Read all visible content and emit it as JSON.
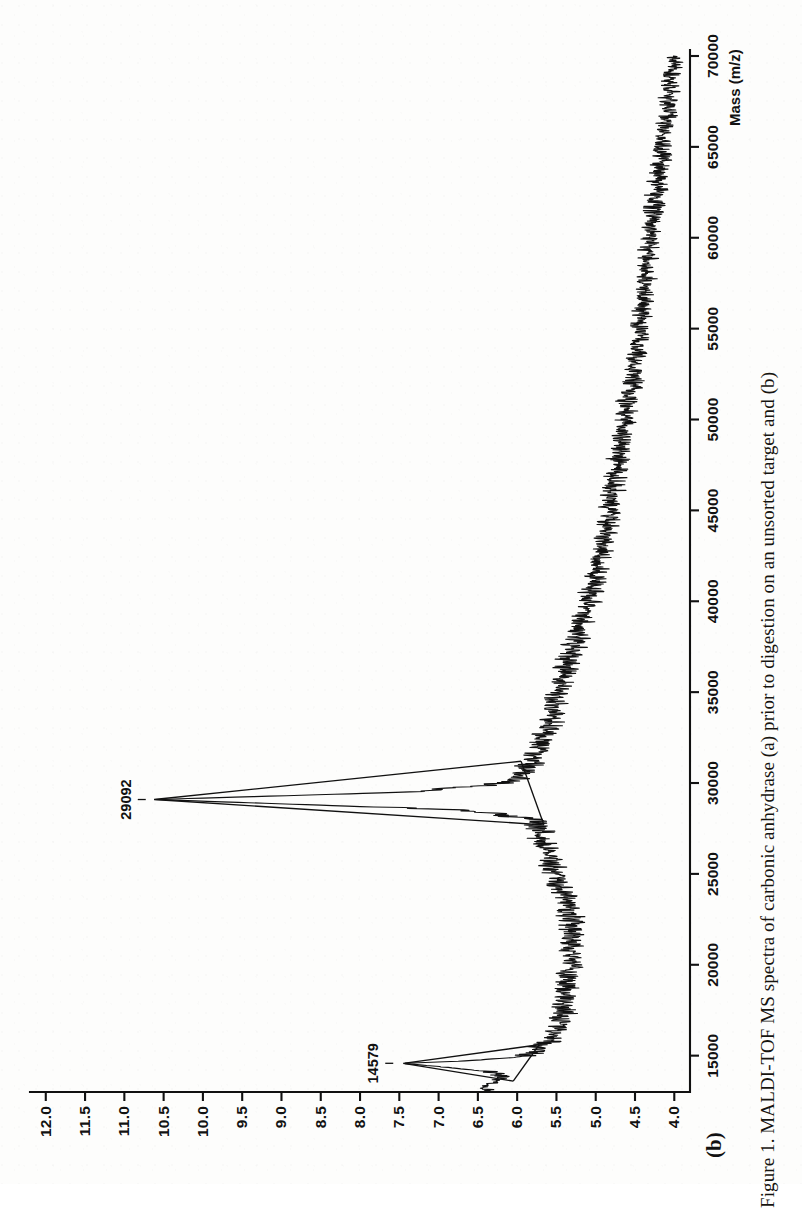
{
  "figure": {
    "panel_label": "(b)",
    "caption": "Figure 1. MALDI-TOF MS spectra of carbonic anhydrase (a) prior to digestion on an unsorted target and (b)"
  },
  "chart_data": {
    "type": "line",
    "title": "",
    "subtitle": "",
    "xlabel": "Mass (m/z)",
    "ylabel": "",
    "xlim": [
      13000,
      70000
    ],
    "ylim": [
      3.8,
      12.15
    ],
    "grid": false,
    "legend": null,
    "x_ticks": [
      15000,
      20000,
      25000,
      30000,
      35000,
      40000,
      45000,
      50000,
      55000,
      60000,
      65000,
      70000
    ],
    "x_tick_labels": [
      "15000",
      "20000",
      "25000",
      "30000",
      "35000",
      "40000",
      "45000",
      "50000",
      "55000",
      "60000",
      "65000",
      "70000"
    ],
    "y_ticks": [
      4.0,
      4.5,
      5.0,
      5.5,
      6.0,
      6.5,
      7.0,
      7.5,
      8.0,
      8.5,
      9.0,
      9.5,
      10.0,
      10.5,
      11.0,
      11.5,
      12.0
    ],
    "y_tick_labels": [
      "4.0",
      "4.5",
      "5.0",
      "5.5",
      "6.0",
      "6.5",
      "7.0",
      "7.5",
      "8.0",
      "8.5",
      "9.0",
      "9.5",
      "10.0",
      "10.5",
      "11.0",
      "11.5",
      "12.0"
    ],
    "annotations": [
      {
        "label": "14579",
        "x": 14579,
        "y": 7.45,
        "note": "doubly charged ion peak"
      },
      {
        "label": "29092",
        "x": 29092,
        "y": 10.6,
        "note": "singly charged molecular ion peak"
      }
    ],
    "baseline_segments": [
      {
        "x": [
          13600,
          14579,
          15600
        ],
        "y": [
          6.05,
          7.45,
          5.72
        ]
      },
      {
        "x": [
          27700,
          29092,
          31200
        ],
        "y": [
          5.66,
          10.62,
          5.95
        ]
      }
    ],
    "series": [
      {
        "name": "intensity",
        "x": [
          13000,
          13200,
          13400,
          13600,
          13800,
          14000,
          14200,
          14400,
          14579,
          14700,
          14900,
          15100,
          15300,
          15500,
          15800,
          16200,
          16600,
          17000,
          17500,
          18000,
          18500,
          19000,
          19500,
          20000,
          20500,
          21000,
          21500,
          22000,
          22500,
          23000,
          23500,
          24000,
          24500,
          25000,
          25500,
          26000,
          26500,
          27000,
          27500,
          28000,
          28500,
          29092,
          29500,
          30000,
          30500,
          31000,
          31500,
          32000,
          33000,
          34000,
          35000,
          36000,
          37000,
          38000,
          39000,
          40000,
          41000,
          42000,
          43000,
          44000,
          45000,
          46000,
          47000,
          48000,
          49000,
          50000,
          51000,
          52000,
          53000,
          54000,
          55000,
          56000,
          57000,
          58000,
          59000,
          60000,
          61000,
          62000,
          63000,
          64000,
          65000,
          66000,
          67000,
          68000,
          69000,
          70000
        ],
        "y": [
          6.4,
          6.42,
          6.38,
          6.3,
          6.18,
          6.3,
          6.55,
          7.0,
          7.45,
          6.7,
          6.05,
          5.8,
          5.72,
          5.68,
          5.6,
          5.52,
          5.46,
          5.44,
          5.42,
          5.4,
          5.38,
          5.36,
          5.34,
          5.32,
          5.3,
          5.28,
          5.3,
          5.3,
          5.32,
          5.34,
          5.38,
          5.42,
          5.46,
          5.52,
          5.56,
          5.6,
          5.64,
          5.68,
          5.7,
          5.8,
          6.6,
          10.62,
          7.4,
          6.1,
          5.95,
          5.85,
          5.78,
          5.72,
          5.62,
          5.54,
          5.48,
          5.4,
          5.32,
          5.24,
          5.18,
          5.1,
          5.02,
          4.96,
          4.9,
          4.86,
          4.82,
          4.78,
          4.74,
          4.7,
          4.66,
          4.62,
          4.58,
          4.54,
          4.5,
          4.47,
          4.44,
          4.41,
          4.38,
          4.35,
          4.33,
          4.3,
          4.27,
          4.24,
          4.21,
          4.18,
          4.15,
          4.12,
          4.09,
          4.06,
          4.03,
          4.0
        ]
      }
    ]
  }
}
